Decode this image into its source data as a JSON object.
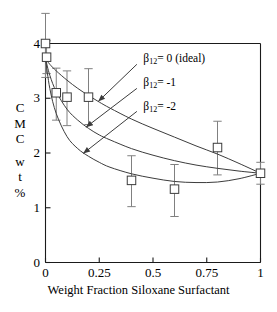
{
  "chart_data": {
    "type": "scatter",
    "title": "",
    "xlabel": "Weight Fraction Siloxane Surfactant",
    "ylabel": "CMC wt %",
    "ylabel_chars": [
      "C",
      "M",
      "C",
      "w",
      "t",
      "%"
    ],
    "xlim": [
      0,
      1
    ],
    "ylim": [
      0,
      4
    ],
    "xticks": [
      "0",
      "0.25",
      "0.5",
      "0.75",
      "1"
    ],
    "xtick_values": [
      0,
      0.25,
      0.5,
      0.75,
      1
    ],
    "yticks": [
      "0",
      "1",
      "2",
      "3",
      "4"
    ],
    "ytick_values": [
      0,
      1,
      2,
      3,
      4
    ],
    "grid": false,
    "legend_position": "inside-upper-right",
    "marker": "open-square",
    "measured": {
      "name": "Measured CMC",
      "x": [
        0.0,
        0.005,
        0.05,
        0.1,
        0.2,
        0.4,
        0.6,
        0.8,
        1.0
      ],
      "y": [
        4.0,
        3.75,
        3.1,
        3.02,
        3.02,
        1.5,
        1.34,
        2.1,
        1.63
      ],
      "yerr_low": [
        0.62,
        0.3,
        0.5,
        0.52,
        0.5,
        0.48,
        0.5,
        0.5,
        0.2
      ],
      "yerr_high": [
        0.55,
        0.3,
        0.45,
        0.48,
        0.52,
        0.45,
        0.45,
        0.48,
        0.2
      ]
    },
    "series": [
      {
        "name": "beta12 = 0 (ideal)",
        "label": "β",
        "sub": "12",
        "label_rest": "= 0  (ideal)",
        "beta": 0,
        "x": [
          0.0,
          0.02,
          0.05,
          0.1,
          0.15,
          0.2,
          0.25,
          0.3,
          0.4,
          0.5,
          0.6,
          0.7,
          0.8,
          0.9,
          1.0
        ],
        "y": [
          3.72,
          3.62,
          3.5,
          3.33,
          3.18,
          3.05,
          2.93,
          2.82,
          2.62,
          2.45,
          2.29,
          2.13,
          1.98,
          1.81,
          1.63
        ]
      },
      {
        "name": "beta12 = -1",
        "label": "β",
        "sub": "12",
        "label_rest": "= -1",
        "beta": -1,
        "x": [
          0.0,
          0.02,
          0.05,
          0.1,
          0.15,
          0.2,
          0.25,
          0.3,
          0.4,
          0.5,
          0.6,
          0.7,
          0.8,
          0.9,
          1.0
        ],
        "y": [
          3.72,
          3.42,
          3.12,
          2.8,
          2.6,
          2.45,
          2.33,
          2.24,
          2.08,
          1.96,
          1.86,
          1.78,
          1.72,
          1.67,
          1.63
        ]
      },
      {
        "name": "beta12 = -2",
        "label": "β",
        "sub": "12",
        "label_rest": "= -2",
        "beta": -2,
        "x": [
          0.0,
          0.02,
          0.05,
          0.1,
          0.15,
          0.2,
          0.25,
          0.3,
          0.4,
          0.5,
          0.6,
          0.7,
          0.8,
          0.9,
          1.0
        ],
        "y": [
          3.72,
          3.18,
          2.72,
          2.3,
          2.08,
          1.94,
          1.83,
          1.74,
          1.62,
          1.54,
          1.48,
          1.46,
          1.47,
          1.53,
          1.63
        ]
      }
    ],
    "annotations": [
      {
        "label_x": 0.455,
        "label_y": 3.72,
        "arrow_from_x": 0.425,
        "arrow_from_y": 3.62,
        "arrow_to_x": 0.245,
        "arrow_to_y": 2.94
      },
      {
        "label_x": 0.455,
        "label_y": 3.27,
        "arrow_from_x": 0.425,
        "arrow_from_y": 3.18,
        "arrow_to_x": 0.188,
        "arrow_to_y": 2.47
      },
      {
        "label_x": 0.455,
        "label_y": 2.84,
        "arrow_from_x": 0.425,
        "arrow_from_y": 2.76,
        "arrow_to_x": 0.175,
        "arrow_to_y": 1.99
      }
    ],
    "colors": {
      "axis": "#1a1a1a",
      "curve": "#3c3c3c",
      "marker_edge": "#3c3c3c",
      "marker_face": "#ffffff",
      "errorbar": "#808080",
      "text": "#000000"
    }
  }
}
